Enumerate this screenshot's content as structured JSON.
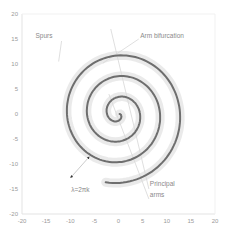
{
  "chart_data": {
    "type": "line",
    "title": "",
    "xlabel": "",
    "ylabel": "",
    "xlim": [
      -20,
      20
    ],
    "ylim": [
      -20,
      20
    ],
    "grid": false,
    "legend": "none",
    "x_ticks": [
      -20,
      -15,
      -10,
      -5,
      0,
      5,
      10,
      15,
      20
    ],
    "y_ticks": [
      20,
      15,
      10,
      5,
      0,
      -5,
      -10,
      -15,
      -20
    ],
    "y_bottom_label": "-20",
    "series": [
      {
        "name": "Principal spiral arm",
        "kind": "archimedean-spiral",
        "r_per_radian": 0.66,
        "theta_start_deg": 20,
        "theta_end_deg": 1210,
        "stroke": "#6e6e6e",
        "halo": "#d9d9d9"
      }
    ],
    "annotations": [
      {
        "text": "Spurs",
        "x": -17.2,
        "y": 15.2
      },
      {
        "text": "Arm bifurcation",
        "x": 4.5,
        "y": 15.2
      },
      {
        "text": "λ=2πk",
        "x": -9.8,
        "y": -15.6
      },
      {
        "text": "Principal",
        "x": 6.5,
        "y": -14.4
      },
      {
        "text": "arms",
        "x": 6.5,
        "y": -16.6
      }
    ],
    "leader_lines": [
      {
        "from": [
          -11.8,
          14.6
        ],
        "to": [
          -12.4,
          10.5
        ]
      },
      {
        "from": [
          4.2,
          15.0
        ],
        "to": [
          -3.2,
          10.2
        ]
      },
      {
        "from": [
          6.3,
          -15.0
        ],
        "to": [
          -1.6,
          17.0
        ]
      },
      {
        "from": [
          6.3,
          -17.0
        ],
        "to": [
          -2.0,
          4.0
        ]
      }
    ],
    "arrow": {
      "from": [
        -6.2,
        -8.7
      ],
      "to": [
        -9.8,
        -12.6
      ],
      "label": "λ=2πk"
    }
  },
  "colors": {
    "axis": "#e3e3e3",
    "tick_text": "#9a9a9a",
    "spiral": "#6e6e6e",
    "halo": "#d9d9d9",
    "leader": "#c9c9c9",
    "arrow": "#333333"
  }
}
